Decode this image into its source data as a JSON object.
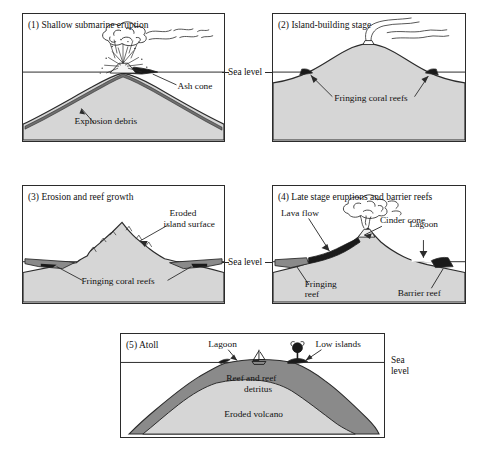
{
  "figure": {
    "sea_level_label": "Sea level",
    "sea_level_label_line1": "Sea",
    "sea_level_label_line2": "level"
  },
  "colors": {
    "ink": "#2b2b2b",
    "volcano_fill": "#d6d6d6",
    "reef_dark": "#8a8a8a",
    "reef_black": "#1a1a1a",
    "debris": "#6f6f6f",
    "panel_border": "#2b2b2b",
    "background": "#ffffff"
  },
  "panels": [
    {
      "number": "(1)",
      "caption": "(1) Shallow submarine eruption",
      "labels": [
        {
          "key": "ash_cone",
          "text": "Ash cone"
        },
        {
          "key": "explosion_debris",
          "text": "Explosion debris"
        }
      ]
    },
    {
      "number": "(2)",
      "caption": "(2) Island-building stage",
      "labels": [
        {
          "key": "fringing_coral_reefs",
          "text": "Fringing  coral reefs"
        }
      ]
    },
    {
      "number": "(3)",
      "caption": "(3) Erosion and reef growth",
      "labels": [
        {
          "key": "eroded_island_surface_l1",
          "text": "Eroded"
        },
        {
          "key": "eroded_island_surface_l2",
          "text": "island surface"
        },
        {
          "key": "fringing_coral_reefs",
          "text": "Fringing coral reefs"
        }
      ]
    },
    {
      "number": "(4)",
      "caption": "(4) Late stage eruptions and barrier reefs",
      "labels": [
        {
          "key": "lava_flow",
          "text": "Lava flow"
        },
        {
          "key": "cinder_cone",
          "text": "Cinder cone"
        },
        {
          "key": "lagoon",
          "text": "Lagoon"
        },
        {
          "key": "fringing_reef_l1",
          "text": "Fringing"
        },
        {
          "key": "fringing_reef_l2",
          "text": "reef"
        },
        {
          "key": "barrier_reef",
          "text": "Barrier reef"
        }
      ]
    },
    {
      "number": "(5)",
      "caption": "(5) Atoll",
      "labels": [
        {
          "key": "lagoon",
          "text": "Lagoon"
        },
        {
          "key": "low_islands",
          "text": "Low islands"
        },
        {
          "key": "reef_and_reef_detritus_l1",
          "text": "Reef and reef"
        },
        {
          "key": "reef_and_reef_detritus_l2",
          "text": "detritus"
        },
        {
          "key": "eroded_volcano",
          "text": "Eroded volcano"
        }
      ]
    }
  ]
}
